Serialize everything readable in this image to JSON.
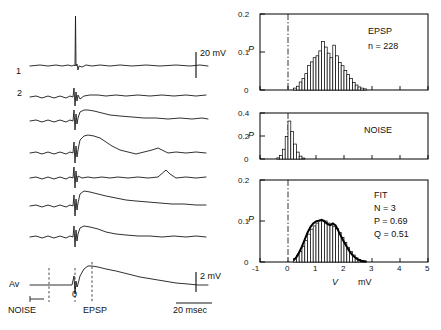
{
  "figure": {
    "left_panel": {
      "trace_labels": [
        "1",
        "2",
        "Av"
      ],
      "scale_bars": [
        {
          "name": "top-scale",
          "label": "20 mV"
        },
        {
          "name": "bottom-scale",
          "label": "2 mV"
        },
        {
          "name": "time-scale",
          "label": "20 msec"
        }
      ],
      "axis_markers": [
        {
          "name": "noise-marker",
          "label": "NOISE"
        },
        {
          "name": "zero-marker",
          "label": "0"
        },
        {
          "name": "epsp-marker",
          "label": "EPSP"
        }
      ]
    },
    "right_panel": {
      "x_axis_label": "V",
      "x_axis_unit": "mV",
      "y_axis_label": "P"
    }
  },
  "chart_data": [
    {
      "type": "bar",
      "name": "EPSP histogram",
      "title": "EPSP",
      "annotations": [
        "EPSP",
        "n = 228"
      ],
      "xlabel": "V",
      "ylabel": "P",
      "xlim": [
        -1,
        5
      ],
      "ylim": [
        0,
        0.2
      ],
      "xticks": [
        -1,
        0,
        1,
        2,
        3,
        4,
        5
      ],
      "yticks": [
        0,
        0.1,
        0.2
      ],
      "bin_width": 0.1,
      "x": [
        0.25,
        0.35,
        0.45,
        0.55,
        0.65,
        0.75,
        0.85,
        0.95,
        1.05,
        1.15,
        1.25,
        1.35,
        1.45,
        1.55,
        1.65,
        1.75,
        1.85,
        1.95,
        2.05,
        2.15,
        2.25,
        2.35,
        2.45,
        2.55,
        2.65,
        2.75
      ],
      "values": [
        0.005,
        0.01,
        0.021,
        0.03,
        0.043,
        0.064,
        0.074,
        0.085,
        0.09,
        0.103,
        0.128,
        0.113,
        0.097,
        0.085,
        0.118,
        0.09,
        0.072,
        0.064,
        0.051,
        0.041,
        0.03,
        0.02,
        0.013,
        0.008,
        0.005,
        0.003
      ],
      "grid": false,
      "legend": "none"
    },
    {
      "type": "bar",
      "name": "NOISE histogram",
      "title": "NOISE",
      "annotations": [
        "NOISE"
      ],
      "xlabel": "V",
      "ylabel": "P",
      "xlim": [
        -1,
        5
      ],
      "ylim": [
        0,
        0.4
      ],
      "xticks": [
        -1,
        0,
        1,
        2,
        3,
        4,
        5
      ],
      "yticks": [
        0,
        0.2,
        0.4
      ],
      "bin_width": 0.1,
      "x": [
        -0.35,
        -0.25,
        -0.15,
        -0.05,
        0.05,
        0.15,
        0.25,
        0.35,
        0.45,
        0.55
      ],
      "values": [
        0.01,
        0.03,
        0.085,
        0.195,
        0.33,
        0.24,
        0.13,
        0.06,
        0.025,
        0.008
      ],
      "grid": false,
      "legend": "none"
    },
    {
      "type": "bar",
      "name": "FIT histogram",
      "title": "FIT",
      "annotations": [
        "FIT",
        "N = 3",
        "P = 0.69",
        "Q = 0.51"
      ],
      "xlabel": "V",
      "ylabel": "P",
      "xlim": [
        -1,
        5
      ],
      "ylim": [
        0,
        0.2
      ],
      "xticks": [
        -1,
        0,
        1,
        2,
        3,
        4,
        5
      ],
      "yticks": [
        0,
        0.1,
        0.2
      ],
      "bin_width": 0.1,
      "x": [
        0.25,
        0.35,
        0.45,
        0.55,
        0.65,
        0.75,
        0.85,
        0.95,
        1.05,
        1.15,
        1.25,
        1.35,
        1.45,
        1.55,
        1.65,
        1.75,
        1.85,
        1.95,
        2.05,
        2.15,
        2.25,
        2.35,
        2.45,
        2.55,
        2.65,
        2.75
      ],
      "values": [
        0.008,
        0.015,
        0.026,
        0.038,
        0.052,
        0.068,
        0.08,
        0.088,
        0.095,
        0.1,
        0.102,
        0.1,
        0.095,
        0.09,
        0.086,
        0.082,
        0.072,
        0.06,
        0.048,
        0.036,
        0.026,
        0.017,
        0.01,
        0.006,
        0.003,
        0.002
      ],
      "series": [
        {
          "name": "fit curve",
          "type": "line",
          "x": [
            0.2,
            0.3,
            0.4,
            0.5,
            0.6,
            0.7,
            0.8,
            0.9,
            1.0,
            1.1,
            1.2,
            1.3,
            1.4,
            1.5,
            1.6,
            1.7,
            1.8,
            1.9,
            2.0,
            2.1,
            2.2,
            2.3,
            2.4,
            2.5,
            2.6,
            2.7,
            2.8
          ],
          "values": [
            0.004,
            0.012,
            0.024,
            0.038,
            0.055,
            0.072,
            0.085,
            0.094,
            0.099,
            0.101,
            0.103,
            0.099,
            0.093,
            0.09,
            0.094,
            0.089,
            0.076,
            0.062,
            0.049,
            0.037,
            0.026,
            0.017,
            0.011,
            0.006,
            0.003,
            0.002,
            0.001
          ]
        }
      ],
      "grid": false,
      "legend": "none"
    }
  ]
}
